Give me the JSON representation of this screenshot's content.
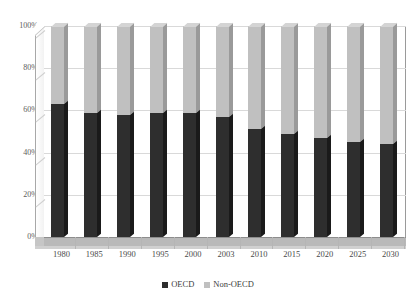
{
  "chart_data": {
    "type": "bar",
    "subtype": "100% stacked column (3-D)",
    "title": "",
    "xlabel": "",
    "ylabel": "",
    "ylim": [
      0,
      100
    ],
    "ytick_labels": [
      "0%",
      "20%",
      "40%",
      "60%",
      "80%",
      "100%"
    ],
    "ytick_values": [
      0,
      20,
      40,
      60,
      80,
      100
    ],
    "grid": true,
    "legend_position": "bottom-center",
    "categories": [
      "1980",
      "1985",
      "1990",
      "1995",
      "2000",
      "2003",
      "2010",
      "2015",
      "2020",
      "2025",
      "2030"
    ],
    "series": [
      {
        "name": "OECD",
        "color": "#2e2e2e",
        "values": [
          63,
          59,
          58,
          59,
          59,
          57,
          51,
          49,
          47,
          45,
          44
        ]
      },
      {
        "name": "Non-OECD",
        "color": "#c0c0c0",
        "values": [
          37,
          41,
          42,
          41,
          41,
          43,
          49,
          51,
          53,
          55,
          56
        ]
      }
    ]
  },
  "legend": {
    "items": [
      {
        "label": "OECD",
        "swatch": "dark-square-icon"
      },
      {
        "label": "Non-OECD",
        "swatch": "light-square-icon"
      }
    ]
  },
  "title_sliver": {
    "text": ""
  },
  "colors": {
    "oecd": "#2e2e2e",
    "non_oecd": "#c0c0c0",
    "plot_background": "#ffffff",
    "gridline": "#d9d9d9",
    "floor": "#b9b9b9",
    "axis_text": "#4a4a4a"
  }
}
